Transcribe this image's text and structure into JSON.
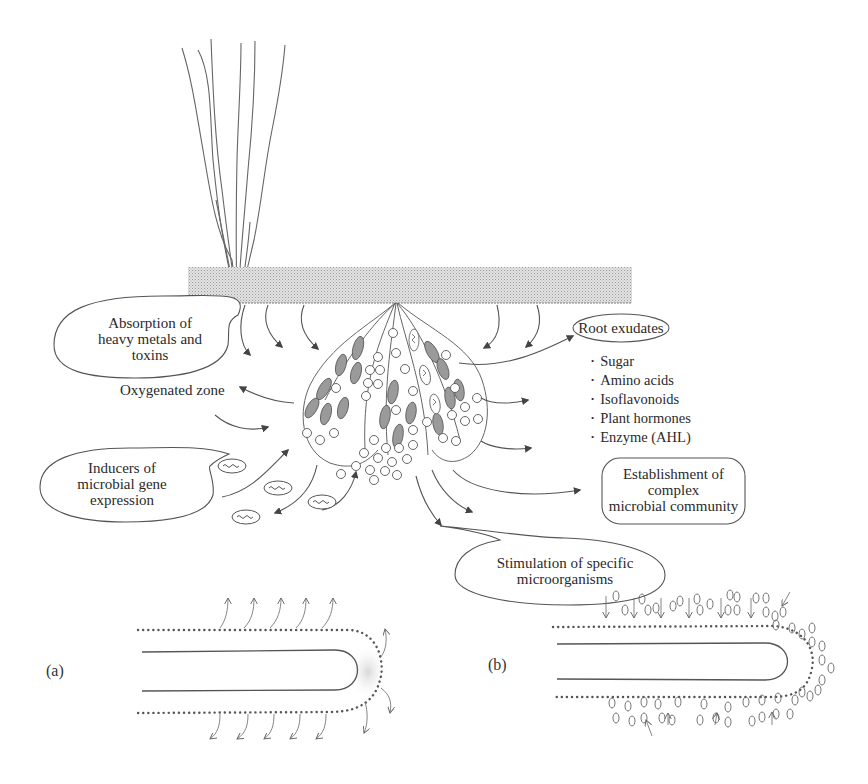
{
  "figure": {
    "type": "rhizosphere-root-interaction-diagram",
    "colors": {
      "line": "#555555",
      "soil_band": "#d4d4d4",
      "cell_fill": "#9a9a9a",
      "text": "#2a2a2a",
      "background": "#ffffff"
    }
  },
  "callouts": {
    "absorption": {
      "line1": "Absorption of",
      "line2": "heavy metals and",
      "line3": "toxins"
    },
    "inducers": {
      "line1": "Inducers of",
      "line2": "microbial gene",
      "line3": "expression"
    },
    "root_exudates": {
      "label": "Root exudates"
    },
    "establishment": {
      "line1": "Establishment of",
      "line2": "complex",
      "line3": "microbial community"
    },
    "stimulation": {
      "line1": "Stimulation of specific",
      "line2": "microorganisms"
    }
  },
  "labels": {
    "oxygenated_zone": "Oxygenated zone"
  },
  "root_exudates_list": [
    "Sugar",
    "Amino acids",
    "Isoflavonoids",
    "Plant hormones",
    "Enzyme (AHL)"
  ],
  "panels": {
    "a": {
      "label": "(a)"
    },
    "b": {
      "label": "(b)"
    }
  }
}
